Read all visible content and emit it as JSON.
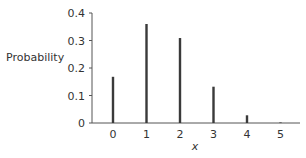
{
  "chart_data": {
    "type": "bar",
    "title": "",
    "xlabel": "x",
    "ylabel": "Probability",
    "categories": [
      "0",
      "1",
      "2",
      "3",
      "4",
      "5"
    ],
    "values": [
      0.168,
      0.36,
      0.309,
      0.132,
      0.028,
      0.002
    ],
    "ylim": [
      0,
      0.4
    ],
    "yticks": [
      "0",
      "0.1",
      "0.2",
      "0.3",
      "0.4"
    ],
    "grid": false,
    "legend": null
  },
  "colors": {
    "bar": "#3a3a3a",
    "axis": "#555555",
    "text": "#333333"
  }
}
